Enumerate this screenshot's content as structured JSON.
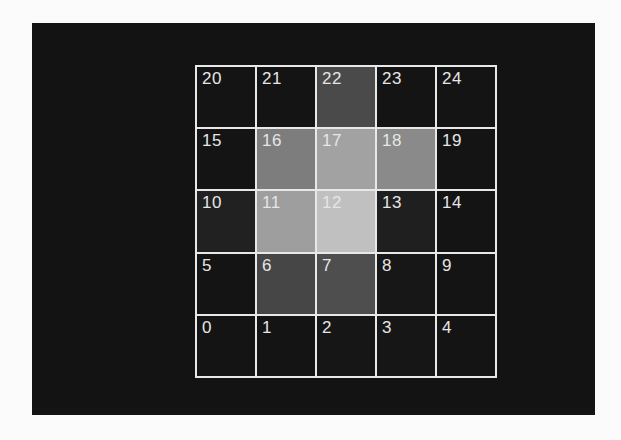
{
  "page": {
    "background_color": "#fbfbfb"
  },
  "figure": {
    "panel_background": "#131313",
    "grid_line_color": "#e8e8e8",
    "cell_label_color": "#e6e6e6"
  },
  "chart_data": {
    "type": "heatmap",
    "title": "",
    "rows": 5,
    "cols": 5,
    "cell_numbering": "states 0-24, numbered left-to-right starting at bottom row",
    "colormap": "grayscale (dark = low value, light = high value)",
    "value_range": [
      0,
      1
    ],
    "peak_cell": "12",
    "cells_display_order": [
      {
        "label": "20",
        "intensity": 0.08,
        "color": "#141414"
      },
      {
        "label": "21",
        "intensity": 0.08,
        "color": "#141414"
      },
      {
        "label": "22",
        "intensity": 0.29,
        "color": "#4a4a4a"
      },
      {
        "label": "23",
        "intensity": 0.08,
        "color": "#141414"
      },
      {
        "label": "24",
        "intensity": 0.08,
        "color": "#141414"
      },
      {
        "label": "15",
        "intensity": 0.08,
        "color": "#141414"
      },
      {
        "label": "16",
        "intensity": 0.49,
        "color": "#7d7d7d"
      },
      {
        "label": "17",
        "intensity": 0.64,
        "color": "#a2a2a2"
      },
      {
        "label": "18",
        "intensity": 0.54,
        "color": "#8a8a8a"
      },
      {
        "label": "19",
        "intensity": 0.08,
        "color": "#141414"
      },
      {
        "label": "10",
        "intensity": 0.13,
        "color": "#212121"
      },
      {
        "label": "11",
        "intensity": 0.62,
        "color": "#9e9e9e"
      },
      {
        "label": "12",
        "intensity": 0.75,
        "color": "#c0c0c0"
      },
      {
        "label": "13",
        "intensity": 0.12,
        "color": "#1f1f1f"
      },
      {
        "label": "14",
        "intensity": 0.08,
        "color": "#141414"
      },
      {
        "label": "5",
        "intensity": 0.08,
        "color": "#141414"
      },
      {
        "label": "6",
        "intensity": 0.27,
        "color": "#464646"
      },
      {
        "label": "7",
        "intensity": 0.31,
        "color": "#4e4e4e"
      },
      {
        "label": "8",
        "intensity": 0.09,
        "color": "#171717"
      },
      {
        "label": "9",
        "intensity": 0.08,
        "color": "#141414"
      },
      {
        "label": "0",
        "intensity": 0.08,
        "color": "#141414"
      },
      {
        "label": "1",
        "intensity": 0.08,
        "color": "#141414"
      },
      {
        "label": "2",
        "intensity": 0.09,
        "color": "#161616"
      },
      {
        "label": "3",
        "intensity": 0.09,
        "color": "#161616"
      },
      {
        "label": "4",
        "intensity": 0.08,
        "color": "#141414"
      }
    ]
  }
}
